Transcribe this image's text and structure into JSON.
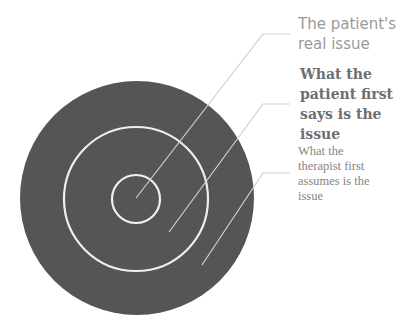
{
  "diagram": {
    "type": "concentric-circles-with-callouts",
    "colors": {
      "outer_circle_fill": "#555555",
      "ring_stroke": "#efefef",
      "leader_line": "#cfcfcf",
      "background": "#ffffff"
    },
    "circles": [
      {
        "name": "outer",
        "cx": 137,
        "cy": 198,
        "r": 117
      },
      {
        "name": "middle",
        "cx": 136,
        "cy": 199,
        "r": 72
      },
      {
        "name": "inner",
        "cx": 136,
        "cy": 199,
        "r": 24
      }
    ],
    "labels": [
      {
        "id": "real",
        "text": "The patient's real issue",
        "lines": [
          "The patient's",
          "real issue"
        ]
      },
      {
        "id": "says",
        "text": "What the patient first says is the issue",
        "lines": [
          "What the",
          "patient first",
          "says is the",
          "issue"
        ]
      },
      {
        "id": "assumes",
        "text": "What the therapist first assumes is the issue",
        "lines": [
          "What the",
          "therapist first",
          "assumes is the",
          "issue"
        ]
      }
    ],
    "leader_lines": [
      {
        "label": "real",
        "points": [
          [
            136,
            198
          ],
          [
            263,
            34
          ],
          [
            290,
            34
          ]
        ]
      },
      {
        "label": "says",
        "points": [
          [
            169,
            232
          ],
          [
            263,
            104
          ],
          [
            290,
            104
          ]
        ]
      },
      {
        "label": "assumes",
        "points": [
          [
            202,
            265
          ],
          [
            263,
            173
          ],
          [
            290,
            173
          ]
        ]
      }
    ]
  }
}
